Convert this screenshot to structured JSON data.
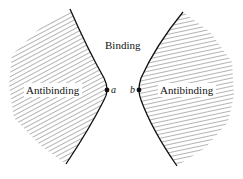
{
  "diagram": {
    "labels": {
      "center": "Binding",
      "left_region": "Antibinding",
      "right_region": "Antibinding",
      "point_a": "a",
      "point_b": "b"
    },
    "colors": {
      "line": "#111111",
      "hatch": "#333333",
      "background": "#ffffff"
    }
  }
}
